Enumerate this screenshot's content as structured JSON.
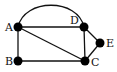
{
  "diagram": {
    "type": "graph",
    "nodes": [
      {
        "id": "A",
        "label": "A",
        "x": 18,
        "y": 27
      },
      {
        "id": "B",
        "label": "B",
        "x": 18,
        "y": 61
      },
      {
        "id": "C",
        "label": "C",
        "x": 85,
        "y": 61
      },
      {
        "id": "D",
        "label": "D",
        "x": 84,
        "y": 27
      },
      {
        "id": "E",
        "label": "E",
        "x": 100,
        "y": 43
      }
    ],
    "edges": [
      {
        "from": "A",
        "to": "D",
        "shape": "arc"
      },
      {
        "from": "A",
        "to": "D",
        "shape": "line"
      },
      {
        "from": "A",
        "to": "B",
        "shape": "line"
      },
      {
        "from": "A",
        "to": "C",
        "shape": "line"
      },
      {
        "from": "B",
        "to": "C",
        "shape": "line"
      },
      {
        "from": "D",
        "to": "C",
        "shape": "line"
      },
      {
        "from": "D",
        "to": "E",
        "shape": "line"
      },
      {
        "from": "E",
        "to": "C",
        "shape": "line"
      }
    ],
    "colors": {
      "node": "#000000",
      "edge": "#111111",
      "background": "#ffffff"
    }
  }
}
